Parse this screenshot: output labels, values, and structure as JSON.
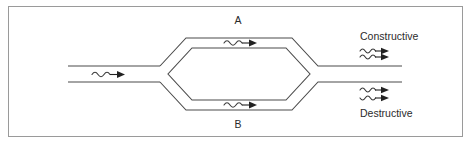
{
  "figure": {
    "type": "optical-interferometer-diagram",
    "title": "",
    "border_color": "#9a9a9a",
    "background_color": "#ffffff",
    "line_color": "#4a4a4a",
    "text_color": "#2b2b2b"
  },
  "labels": {
    "arm_top": "A",
    "arm_bottom": "B",
    "output_top": "Constructive",
    "output_bottom": "Destructive"
  },
  "icons": {
    "input_wave": "wavy-arrow-icon",
    "arm_top_wave": "wavy-arrow-icon",
    "arm_bottom_wave": "wavy-arrow-icon",
    "constructive_wave_1": "wavy-arrow-icon",
    "constructive_wave_2": "wavy-arrow-icon",
    "destructive_wave_1": "wavy-arrow-icon",
    "destructive_wave_2": "wavy-arrow-icon"
  },
  "structure": {
    "input_ports": 1,
    "arms": 2,
    "output_ports": 2
  }
}
